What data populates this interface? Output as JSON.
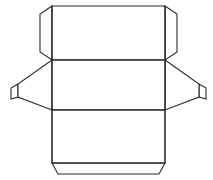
{
  "document": {
    "title": "Box Die-Cut Template",
    "kind": "packaging-net-line-drawing",
    "background_color": "#ffffff",
    "line_color": "#2b2b2b",
    "fill_color": "#ffffff",
    "stroke_width": 1.1,
    "canvas": {
      "width": 213,
      "height": 180
    }
  },
  "shapes": {
    "top_panel": {
      "name": "top-panel",
      "points": "52,6 165,6 165,60 52,60"
    },
    "middle_panel": {
      "name": "middle-panel",
      "points": "52,60 165,60 165,110 52,110"
    },
    "bottom_panel": {
      "name": "bottom-panel",
      "points": "52,110 165,110 165,163 52,163"
    },
    "top_left_flap": {
      "name": "top-left-side-flap",
      "points": "52,6 40,14 40,52 52,60"
    },
    "top_right_flap": {
      "name": "top-right-side-flap",
      "points": "165,6 177,14 177,52 165,60"
    },
    "left_wing": {
      "name": "left-wing-flap",
      "points": "52,60 18,84 18,97 52,110"
    },
    "left_wing_tab": {
      "name": "left-wing-edge-tab",
      "points": "18,84 11,88 11,99 18,97"
    },
    "right_wing": {
      "name": "right-wing-flap",
      "points": "165,60 199,84 199,97 165,110"
    },
    "right_wing_tab": {
      "name": "right-wing-edge-tab",
      "points": "199,84 206,88 206,99 199,97"
    },
    "bottom_flap": {
      "name": "bottom-closure-flap",
      "points": "52,163 165,163 159,174 58,174"
    },
    "fold_top_middle": {
      "name": "fold-line-top-middle",
      "path": "M 52 60 L 165 60"
    },
    "fold_middle_bottom": {
      "name": "fold-line-middle-bottom",
      "path": "M 52 110 L 165 110"
    },
    "fold_bottom_flap": {
      "name": "fold-line-bottom-flap",
      "path": "M 52 163 L 165 163"
    },
    "fold_left_edge": {
      "name": "fold-line-left-vertical",
      "path": "M 52 6 L 52 163"
    },
    "fold_right_edge": {
      "name": "fold-line-right-vertical",
      "path": "M 165 6 L 165 163"
    }
  }
}
